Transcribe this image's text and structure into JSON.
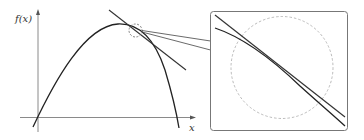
{
  "diagram": {
    "y_axis_label": "f(x)",
    "x_axis_label": "x",
    "colors": {
      "axis": "#7a7a7a",
      "curve": "#222222",
      "tangent": "#333333",
      "dashed_circle": "#999999",
      "inset_border": "#777777",
      "connector": "#444444"
    },
    "elements": [
      "Concave-down curve f(x) starting near origin, peaking, and descending steeply",
      "Tangent line touching curve just right of the peak",
      "Dashed circle marking magnified region",
      "Inset box showing zoomed view where curve and tangent line nearly coincide"
    ]
  }
}
